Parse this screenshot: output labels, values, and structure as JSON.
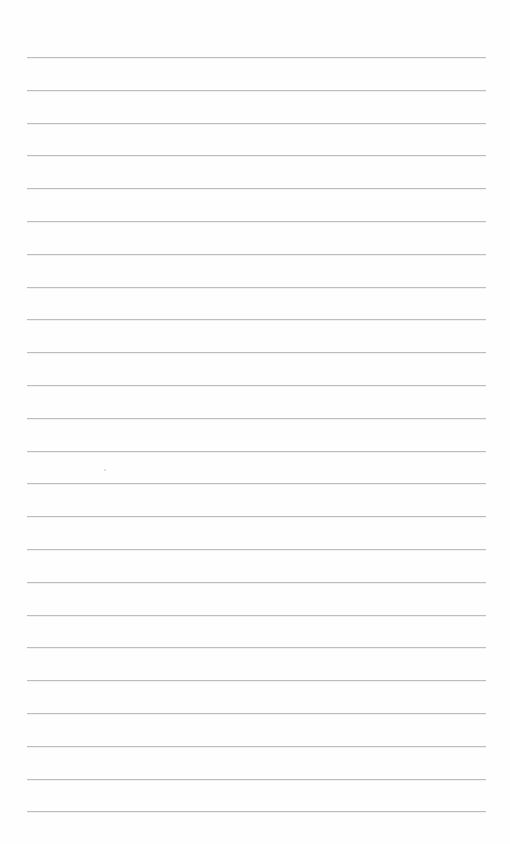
{
  "page": {
    "type": "lined-paper",
    "background_color": "#fefefe",
    "line_color": "#bdbdbd",
    "line_count": 24,
    "first_line_y": 57,
    "line_spacing": 32.8,
    "line_left_x": 27,
    "line_right_x": 486,
    "text": ""
  }
}
